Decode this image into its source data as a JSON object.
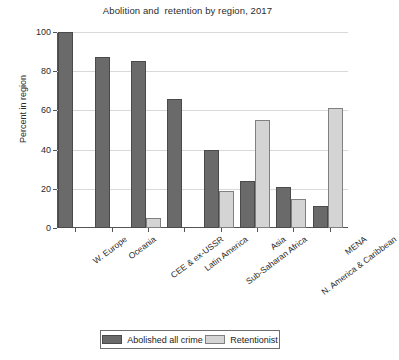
{
  "chart_data": {
    "type": "bar",
    "title": "Abolition and  retention by region, 2017",
    "xlabel": "",
    "ylabel": "Percent in region",
    "ylim": [
      0,
      100
    ],
    "yticks": [
      0,
      20,
      40,
      60,
      80,
      100
    ],
    "ytick_labels": [
      "0",
      "20",
      "40",
      "60",
      "80",
      "100"
    ],
    "grid": true,
    "legend_position": "bottom",
    "categories": [
      "W. Europe",
      "Oceania",
      "CEE & ex-USSR",
      "Latin America",
      "Sub-Saharan Africa",
      "Asia",
      "N. America & Caribbean",
      "MENA"
    ],
    "series": [
      {
        "name": "Abolished all crime",
        "color": "#6a6a6a",
        "values": [
          100,
          87,
          85,
          66,
          40,
          24,
          21,
          11
        ]
      },
      {
        "name": "Retentionist",
        "color": "#d4d4d4",
        "values": [
          0,
          0,
          5,
          0,
          19,
          55,
          15,
          61
        ]
      }
    ]
  },
  "legend": {
    "items": [
      {
        "label": "Abolished all crime"
      },
      {
        "label": "Retentionist"
      }
    ]
  }
}
